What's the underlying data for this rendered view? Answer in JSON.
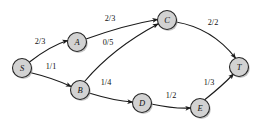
{
  "diagram": {
    "type": "flow-network-graph",
    "title": "",
    "canvas": {
      "width": 260,
      "height": 124,
      "background": "#ffffff"
    },
    "style": {
      "node_fill": "#d2d2d2",
      "node_stroke": "#262626",
      "edge_stroke": "#1b1b1b",
      "label_color": "#111111"
    },
    "label_format": "flow/capacity",
    "nodes": [
      {
        "id": "S",
        "label": "S",
        "cx": 22,
        "cy": 68,
        "r": 9.5
      },
      {
        "id": "A",
        "label": "A",
        "cx": 77,
        "cy": 42,
        "r": 9.5
      },
      {
        "id": "B",
        "label": "B",
        "cx": 80,
        "cy": 90,
        "r": 9.5
      },
      {
        "id": "C",
        "label": "C",
        "cx": 167,
        "cy": 20,
        "r": 9.5
      },
      {
        "id": "D",
        "label": "D",
        "cx": 142,
        "cy": 103,
        "r": 9.5
      },
      {
        "id": "E",
        "label": "E",
        "cx": 200,
        "cy": 108,
        "r": 9.5
      },
      {
        "id": "T",
        "label": "T",
        "cx": 239,
        "cy": 67,
        "r": 9.5
      }
    ],
    "edges": [
      {
        "id": "S-A",
        "from": "S",
        "to": "A",
        "label": "2/3",
        "flow": 2,
        "capacity": 3,
        "path": "M 29.5 62 Q 50 46 67.5 40.5",
        "label_x": 40,
        "label_y": 41
      },
      {
        "id": "S-B",
        "from": "S",
        "to": "B",
        "label": "1/1",
        "flow": 1,
        "capacity": 1,
        "path": "M 30 72.5 Q 53 78 71 86.5",
        "label_x": 51,
        "label_y": 66
      },
      {
        "id": "A-C",
        "from": "A",
        "to": "C",
        "label": "2/3",
        "flow": 2,
        "capacity": 3,
        "path": "M 86 39 Q 125 25 157.5 19.5",
        "label_x": 110,
        "label_y": 18
      },
      {
        "id": "B-C",
        "from": "B",
        "to": "C",
        "label": "0/5",
        "flow": 0,
        "capacity": 5,
        "path": "M 85 81 Q 113 48 158 24",
        "label_x": 108,
        "label_y": 42
      },
      {
        "id": "C-T",
        "from": "C",
        "to": "T",
        "label": "2/2",
        "flow": 2,
        "capacity": 2,
        "path": "M 176 22 Q 212 28 235.5 58",
        "label_x": 213,
        "label_y": 22
      },
      {
        "id": "B-D",
        "from": "B",
        "to": "D",
        "label": "1/4",
        "flow": 1,
        "capacity": 4,
        "path": "M 89 93 Q 115 101 132.5 102",
        "label_x": 106,
        "label_y": 82
      },
      {
        "id": "D-E",
        "from": "D",
        "to": "E",
        "label": "1/2",
        "flow": 1,
        "capacity": 2,
        "path": "M 151 104 Q 175 109 190.5 108",
        "label_x": 171,
        "label_y": 95
      },
      {
        "id": "E-T",
        "from": "E",
        "to": "T",
        "label": "1/3",
        "flow": 1,
        "capacity": 3,
        "path": "M 205 99.5 Q 222 86 233.5 74",
        "label_x": 209,
        "label_y": 82
      }
    ]
  }
}
